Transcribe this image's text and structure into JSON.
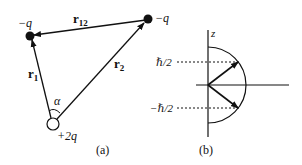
{
  "figure_a": {
    "caption": "(a)",
    "charges": {
      "left": "−q",
      "right": "−q",
      "origin": "+2q"
    },
    "vectors": {
      "r1": {
        "main": "r",
        "sub": "1"
      },
      "r2": {
        "main": "r",
        "sub": "2"
      },
      "r12": {
        "main": "r",
        "sub": "12"
      }
    },
    "angle_label": "α"
  },
  "figure_b": {
    "caption": "(b)",
    "axis_label": "z",
    "level_up": "ℏ/2",
    "level_down": "−ℏ/2"
  },
  "colors": {
    "ink": "#111111",
    "background": "#ffffff"
  }
}
